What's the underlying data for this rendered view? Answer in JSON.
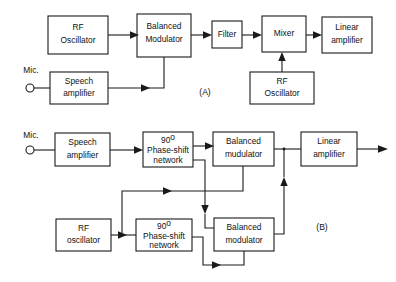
{
  "figure": {
    "panels": [
      {
        "id": "A",
        "label": "(A)",
        "method": "filter method"
      },
      {
        "id": "B",
        "label": "(B)",
        "method": "phasing method"
      }
    ]
  },
  "panel_a": {
    "label": "(A)",
    "blocks": {
      "rf_oscillator_top": {
        "line1": "RF",
        "line2": "Oscillator"
      },
      "balanced_modulator": {
        "line1": "Balanced",
        "line2": "Modulator"
      },
      "filter": {
        "line1": "Filter"
      },
      "mixer": {
        "line1": "Mixer"
      },
      "linear_amplifier": {
        "line1": "Linear",
        "line2": "amplifier"
      },
      "speech_amplifier": {
        "line1": "Speech",
        "line2": "amplifier"
      },
      "rf_oscillator_bottom": {
        "line1": "RF",
        "line2": "Oscillator"
      }
    },
    "mic_label": "Mic."
  },
  "panel_b": {
    "label": "(B)",
    "blocks": {
      "speech_amplifier": {
        "line1": "Speech",
        "line2": "amplifier"
      },
      "phase_shift_top": {
        "deg": "90",
        "sup": "o",
        "line2": "Phase-shift",
        "line3": "network"
      },
      "balanced_modulator_top": {
        "line1": "Balanced",
        "line2": "mudulator"
      },
      "linear_amplifier": {
        "line1": "Linear",
        "line2": "amplifier"
      },
      "rf_oscillator": {
        "line1": "RF",
        "line2": "oscillator"
      },
      "phase_shift_bottom": {
        "deg": "90",
        "sup": "o",
        "line2": "Phase-shift",
        "line3": "network"
      },
      "balanced_modulator_bottom": {
        "line1": "Balanced",
        "line2": "modulator"
      }
    },
    "mic_label": "Mic."
  },
  "colors": {
    "stroke": "#1a1a1a",
    "text": "#111111",
    "background": "#ffffff"
  }
}
